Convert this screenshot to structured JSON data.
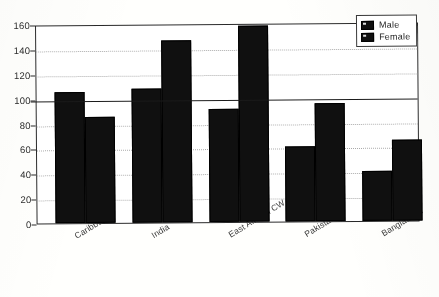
{
  "chart_data": {
    "type": "bar",
    "title": "",
    "xlabel": "",
    "ylabel": "",
    "ylim": [
      0,
      160
    ],
    "ytick_step": 20,
    "yticks": [
      160,
      140,
      120,
      100,
      80,
      60,
      40,
      20,
      0
    ],
    "grid": true,
    "legend_position": "top-right",
    "categories": [
      "Caribbean",
      "India",
      "East African CW",
      "Pakistan",
      "Bangladesh"
    ],
    "series": [
      {
        "name": "Male",
        "values": [
          105,
          108,
          91,
          60,
          40
        ]
      },
      {
        "name": "Female",
        "values": [
          85,
          146,
          158,
          95,
          65
        ]
      }
    ],
    "annotations": [
      {
        "type": "reference-line",
        "axis": "y",
        "value": 100
      }
    ]
  },
  "legend": {
    "items": [
      {
        "label": "Male",
        "swatch": "black-square-icon"
      },
      {
        "label": "Female",
        "swatch": "black-square-icon"
      }
    ]
  },
  "colors": {
    "bar": "#121212",
    "axis": "#2b2b2b",
    "gridline": "#a8a8a8",
    "reference_line": "#1d1d1d",
    "background": "#fdfdfb"
  }
}
